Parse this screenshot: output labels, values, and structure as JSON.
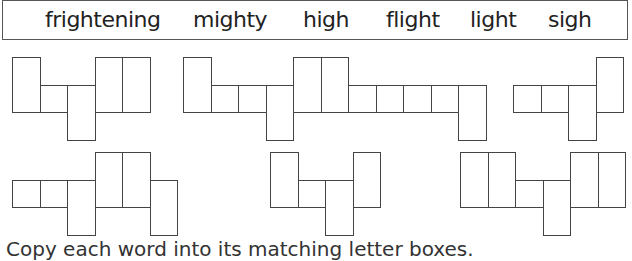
{
  "word_bank": {
    "words": [
      {
        "text": "frightening",
        "x": 42
      },
      {
        "text": "mighty",
        "x": 190
      },
      {
        "text": "high",
        "x": 300
      },
      {
        "text": "flight",
        "x": 383
      },
      {
        "text": "light",
        "x": 467
      },
      {
        "text": "sigh",
        "x": 545
      }
    ]
  },
  "metrics": {
    "unit": 27.5
  },
  "shapes": [
    {
      "name": "shape-light",
      "x": 12,
      "top": 57,
      "letters": [
        "tall",
        "short",
        "desc",
        "tall",
        "tall"
      ]
    },
    {
      "name": "shape-frightening",
      "x": 183,
      "top": 57,
      "letters": [
        "tall",
        "short",
        "short",
        "desc",
        "tall",
        "tall",
        "short",
        "short",
        "short",
        "short",
        "desc"
      ]
    },
    {
      "name": "shape-sigh",
      "x": 513,
      "top": 57,
      "letters": [
        "short",
        "short",
        "desc",
        "tall"
      ]
    },
    {
      "name": "shape-mighty",
      "x": 12,
      "top": 152,
      "letters": [
        "short",
        "short",
        "desc",
        "tall",
        "tall",
        "desc"
      ]
    },
    {
      "name": "shape-high",
      "x": 270,
      "top": 152,
      "letters": [
        "tall",
        "short",
        "desc",
        "tall"
      ]
    },
    {
      "name": "shape-flight",
      "x": 460,
      "top": 152,
      "letters": [
        "tall",
        "tall",
        "short",
        "desc",
        "tall",
        "tall"
      ]
    }
  ],
  "footer": {
    "text": "Copy each word into its matching letter boxes."
  }
}
